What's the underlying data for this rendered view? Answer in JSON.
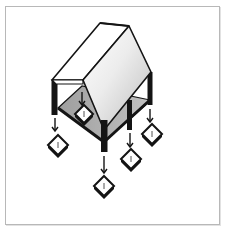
{
  "figure": {
    "colors": {
      "background": "#ffffff",
      "frame_border": "#b8b8b8",
      "ink": "#141414",
      "roof_light": "#ffffff",
      "roof_shade": "#d6d6d6",
      "floor_shade": "#a9a9a9"
    },
    "elements": {
      "roof": {
        "type": "gable"
      },
      "posts": 4,
      "load_arrows": 5,
      "pile_caps": 5
    }
  }
}
